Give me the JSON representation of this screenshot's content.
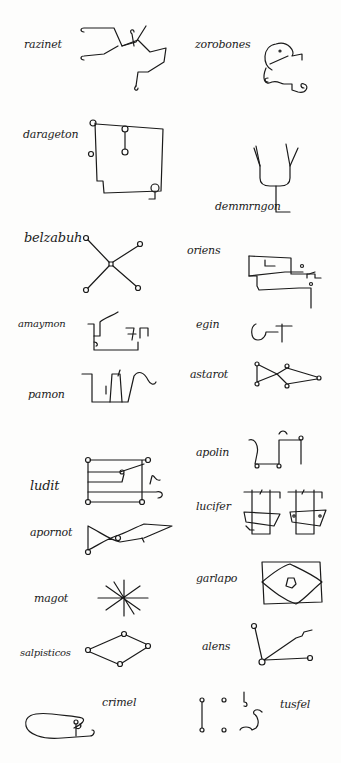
{
  "document": {
    "type": "manuscript page of demon sigils",
    "entries": [
      {
        "name": "razinet",
        "column": "left"
      },
      {
        "name": "zorobones",
        "column": "right"
      },
      {
        "name": "darageton",
        "column": "left"
      },
      {
        "name": "demmrngon",
        "column": "right"
      },
      {
        "name": "belzabuh",
        "column": "left"
      },
      {
        "name": "oriens",
        "column": "right"
      },
      {
        "name": "amaymon",
        "column": "left"
      },
      {
        "name": "egin",
        "column": "right"
      },
      {
        "name": "pamon",
        "column": "left"
      },
      {
        "name": "astarot",
        "column": "right"
      },
      {
        "name": "ludit",
        "column": "left"
      },
      {
        "name": "apolin",
        "column": "right"
      },
      {
        "name": "apornot",
        "column": "left"
      },
      {
        "name": "lucifer",
        "column": "right"
      },
      {
        "name": "magot",
        "column": "left"
      },
      {
        "name": "garlapo",
        "column": "right"
      },
      {
        "name": "salpisticos",
        "column": "left"
      },
      {
        "name": "alens",
        "column": "right"
      },
      {
        "name": "crimel",
        "column": "left"
      },
      {
        "name": "tusfel",
        "column": "right"
      }
    ]
  }
}
